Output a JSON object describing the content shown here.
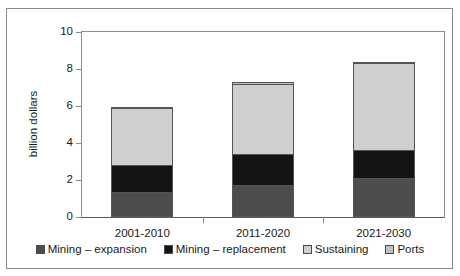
{
  "chart_data": {
    "type": "bar",
    "subtype": "stacked",
    "title": "",
    "xlabel": "",
    "ylabel": "billion dollars",
    "ylim": [
      0,
      10
    ],
    "yticks": [
      0,
      2,
      4,
      6,
      8,
      10
    ],
    "ytick_labels": [
      "0",
      "2",
      "4",
      "6",
      "8",
      "10"
    ],
    "grid": false,
    "legend_position": "bottom",
    "categories": [
      "2001-2010",
      "2011-2020",
      "2021-2030"
    ],
    "series": [
      {
        "name": "Mining – expansion",
        "color": "#4d4d4d",
        "values": [
          1.35,
          1.75,
          2.1
        ]
      },
      {
        "name": "Mining – replacement",
        "color": "#141414",
        "values": [
          1.5,
          1.7,
          1.55
        ]
      },
      {
        "name": "Sustaining",
        "color": "#cfcfcf",
        "values": [
          3.15,
          3.85,
          4.8
        ]
      },
      {
        "name": "Ports",
        "color": "#c2c2c2",
        "values": [
          0.1,
          0.15,
          0.1
        ]
      }
    ],
    "totals": [
      6.1,
      7.45,
      8.55
    ]
  },
  "axes": {
    "y_label": "billion dollars",
    "y_ticks": [
      {
        "value": 10,
        "label": "10"
      },
      {
        "value": 8,
        "label": "8"
      },
      {
        "value": 6,
        "label": "6"
      },
      {
        "value": 4,
        "label": "4"
      },
      {
        "value": 2,
        "label": "2"
      },
      {
        "value": 0,
        "label": "0"
      }
    ],
    "x_categories": [
      {
        "label": "2001-2010"
      },
      {
        "label": "2011-2020"
      },
      {
        "label": "2021-2030"
      }
    ]
  },
  "legend": {
    "items": [
      {
        "label": "Mining – expansion",
        "color": "#4d4d4d"
      },
      {
        "label": "Mining – replacement",
        "color": "#141414"
      },
      {
        "label": "Sustaining",
        "color": "#cfcfcf"
      },
      {
        "label": "Ports",
        "color": "#c2c2c2"
      }
    ]
  },
  "colors": {
    "frame_border": "#8a8a8a",
    "axis": "#8c8c8c",
    "baseline": "#5a5a5a",
    "background": "#ffffff",
    "text": "#1a1a1a"
  }
}
